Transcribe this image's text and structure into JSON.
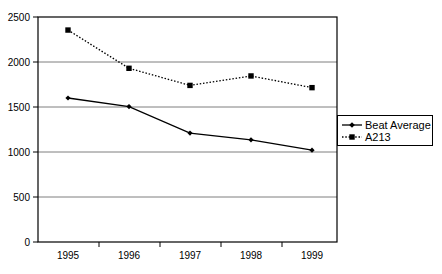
{
  "chart_data": {
    "type": "line",
    "title": "",
    "xlabel": "",
    "ylabel": "",
    "categories": [
      "1995",
      "1996",
      "1997",
      "1998",
      "1999"
    ],
    "ylim": [
      0,
      2500
    ],
    "yticks": [
      0,
      500,
      1000,
      1500,
      2000,
      2500
    ],
    "ytick_labels": [
      "0",
      "500",
      "1000",
      "1500",
      "2000",
      "2500"
    ],
    "grid": "horizontal",
    "legend_position": "right",
    "series": [
      {
        "name": "Beat Average",
        "values": [
          1600,
          1505,
          1210,
          1135,
          1020
        ],
        "line_style": "solid",
        "marker": "diamond",
        "color": "#000000"
      },
      {
        "name": "A213",
        "values": [
          2355,
          1930,
          1740,
          1845,
          1715
        ],
        "line_style": "dotted",
        "marker": "square",
        "color": "#000000"
      }
    ]
  },
  "legend": {
    "items": [
      {
        "label": "Beat Average"
      },
      {
        "label": "A213"
      }
    ]
  },
  "colors": {
    "plot_border": "#000000",
    "gridline": "#808080",
    "background": "#ffffff",
    "series": "#000000"
  }
}
